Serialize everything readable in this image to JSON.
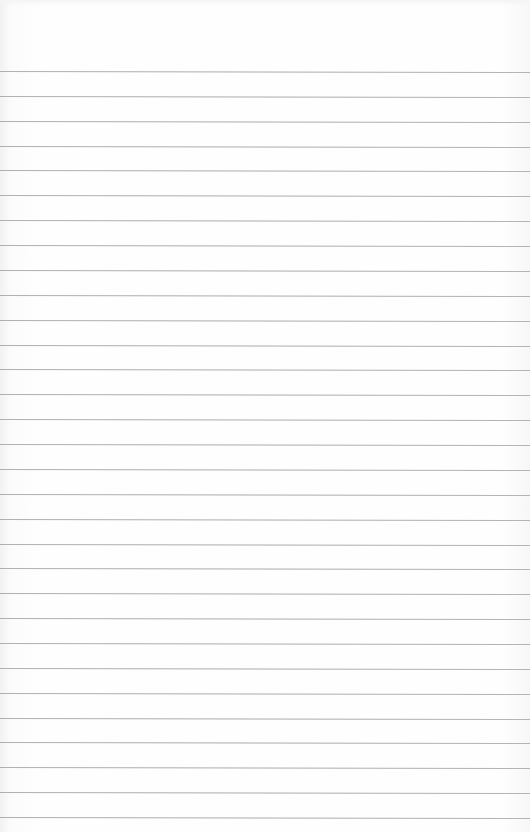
{
  "document": {
    "type": "lined-paper",
    "content": "",
    "paper_color": "#fdfdfd",
    "line_color": "#9e9e9e",
    "line_count": 31,
    "first_line_y": 71,
    "line_spacing": 24.87
  }
}
